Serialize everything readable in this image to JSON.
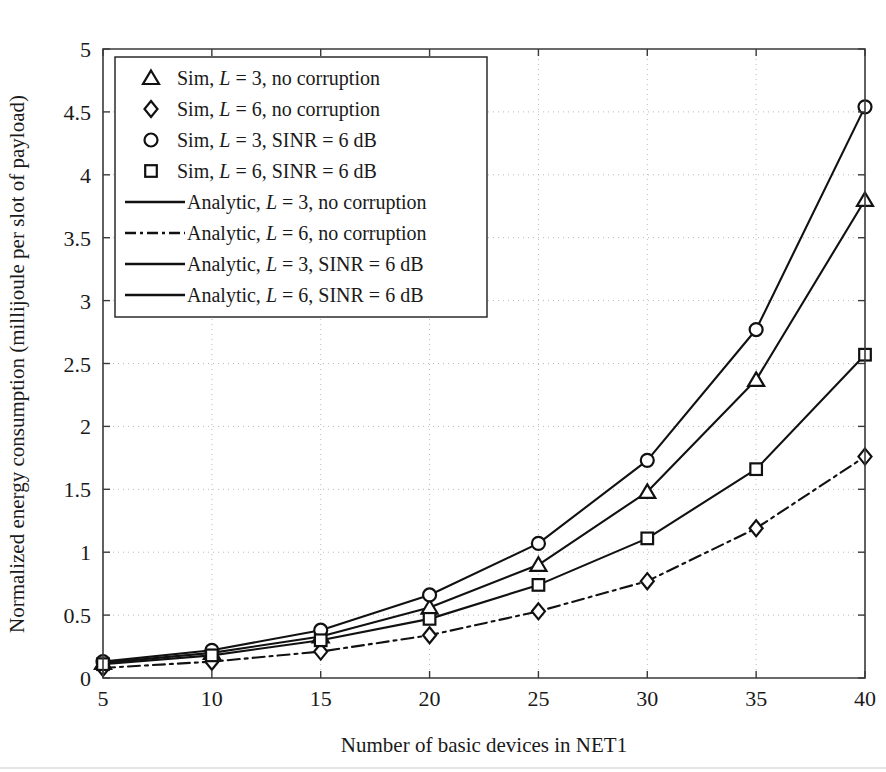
{
  "chart_data": {
    "type": "line",
    "title": "",
    "xlabel": "Number of basic devices in NET1",
    "ylabel": "Normalized energy consumption (millijoule per slot of payload)",
    "x": [
      5,
      10,
      15,
      20,
      25,
      30,
      35,
      40
    ],
    "xlim": [
      5,
      40
    ],
    "ylim": [
      0,
      5
    ],
    "xticks": [
      "5",
      "10",
      "15",
      "20",
      "25",
      "30",
      "35",
      "40"
    ],
    "yticks": [
      "0",
      "0.5",
      "1",
      "1.5",
      "2",
      "2.5",
      "3",
      "3.5",
      "4",
      "4.5",
      "5"
    ],
    "grid": "dotted both axes",
    "legend_position": "upper left inside",
    "series": [
      {
        "name": "Sim, L = 3, no corruption",
        "marker": "triangle",
        "line": "none",
        "values": [
          0.12,
          0.2,
          0.33,
          0.56,
          0.9,
          1.48,
          2.37,
          3.8
        ]
      },
      {
        "name": "Sim, L = 6, no corruption",
        "marker": "diamond",
        "line": "none",
        "values": [
          0.08,
          0.13,
          0.21,
          0.34,
          0.53,
          0.77,
          1.19,
          1.76
        ]
      },
      {
        "name": "Sim, L = 3, SINR = 6 dB",
        "marker": "circle",
        "line": "none",
        "values": [
          0.13,
          0.22,
          0.38,
          0.66,
          1.07,
          1.73,
          2.77,
          4.54
        ]
      },
      {
        "name": "Sim, L = 6, SINR = 6 dB",
        "marker": "square",
        "line": "none",
        "values": [
          0.11,
          0.18,
          0.3,
          0.47,
          0.74,
          1.11,
          1.66,
          2.57
        ]
      },
      {
        "name": "Analytic, L = 3, no corruption",
        "marker": "none",
        "line": "solid",
        "values": [
          0.12,
          0.2,
          0.33,
          0.56,
          0.9,
          1.48,
          2.37,
          3.8
        ]
      },
      {
        "name": "Analytic, L = 6, no corruption",
        "marker": "none",
        "line": "dashdot",
        "values": [
          0.08,
          0.13,
          0.21,
          0.34,
          0.53,
          0.77,
          1.19,
          1.76
        ]
      },
      {
        "name": "Analytic, L = 3, SINR = 6 dB",
        "marker": "none",
        "line": "solid",
        "values": [
          0.13,
          0.22,
          0.38,
          0.66,
          1.07,
          1.73,
          2.77,
          4.54
        ]
      },
      {
        "name": "Analytic, L = 6, SINR = 6 dB",
        "marker": "none",
        "line": "solid",
        "values": [
          0.11,
          0.18,
          0.3,
          0.47,
          0.74,
          1.11,
          1.66,
          2.57
        ]
      }
    ],
    "colors": {
      "line": "#111111",
      "axis": "#3a3a3a",
      "grid": "#b9b9b9",
      "background": "#ffffff"
    }
  },
  "legend": {
    "entries": [
      {
        "symbol": "triangle",
        "prefix": "Sim, ",
        "var": "L",
        "suffix": " = 3, no corruption"
      },
      {
        "symbol": "diamond",
        "prefix": "Sim, ",
        "var": "L",
        "suffix": " = 6, no corruption"
      },
      {
        "symbol": "circle",
        "prefix": "Sim, ",
        "var": "L",
        "suffix": " = 3, SINR = 6 dB"
      },
      {
        "symbol": "square",
        "prefix": "Sim, ",
        "var": "L",
        "suffix": " = 6, SINR = 6 dB"
      },
      {
        "symbol": "line-solid",
        "prefix": "Analytic, ",
        "var": "L",
        "suffix": " = 3, no corruption"
      },
      {
        "symbol": "line-dashdot",
        "prefix": "Analytic, ",
        "var": "L",
        "suffix": " = 6, no corruption"
      },
      {
        "symbol": "line-solid",
        "prefix": "Analytic, ",
        "var": "L",
        "suffix": " = 3, SINR = 6 dB"
      },
      {
        "symbol": "line-solid",
        "prefix": "Analytic, ",
        "var": "L",
        "suffix": " = 6, SINR = 6 dB"
      }
    ]
  }
}
